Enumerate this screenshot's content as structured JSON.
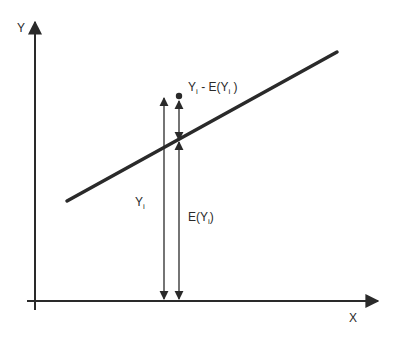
{
  "diagram": {
    "type": "regression-decomposition",
    "colors": {
      "ink": "#2a2a2a",
      "background": "#ffffff"
    },
    "axes": {
      "y_label": "Y",
      "x_label": "X"
    },
    "regression_line": {
      "label": "E(Y) line"
    },
    "annotations": {
      "residual": {
        "base": "Y",
        "sub": "i",
        "rest": " - E(Y",
        "sub2": "i",
        "end": " )"
      },
      "observed": {
        "base": "Y",
        "sub": "i"
      },
      "expected": {
        "pre": "E(Y",
        "sub": "i",
        "end": ")"
      }
    }
  }
}
